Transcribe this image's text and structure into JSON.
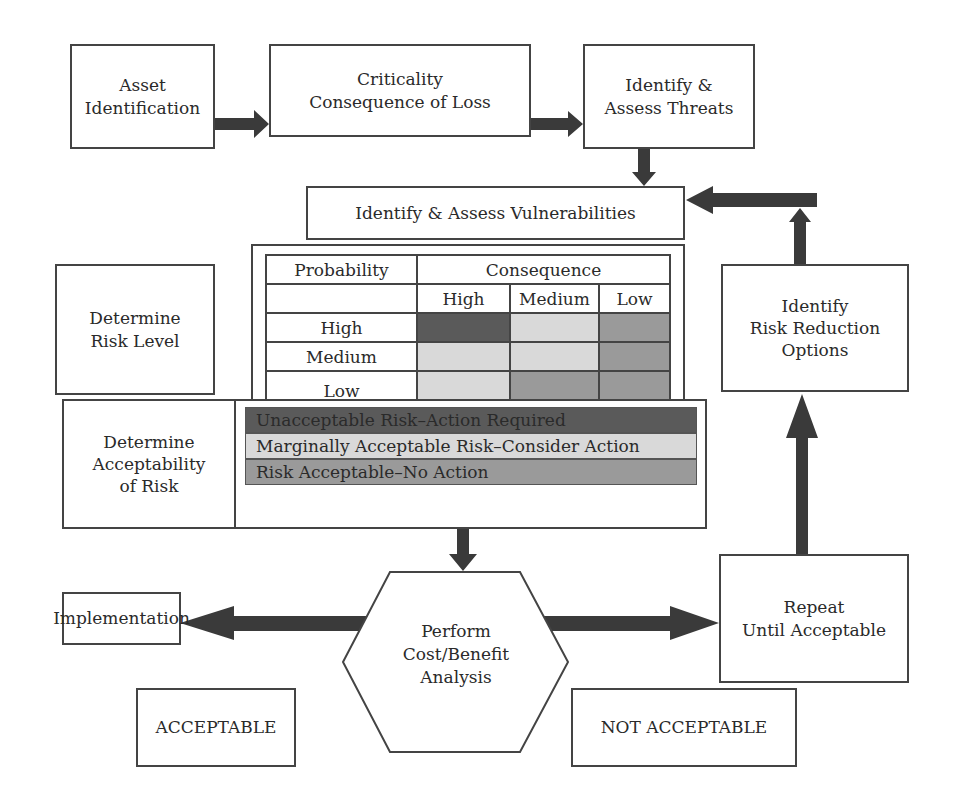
{
  "diagram": {
    "colors": {
      "unacceptable": "#5a5a5a",
      "marginal": "#d9d9d9",
      "acceptable": "#9a9a9a",
      "arrow": "#3a3a3a",
      "border": "#444444"
    },
    "nodes": {
      "asset_identification": {
        "line1": "Asset",
        "line2": "Identification"
      },
      "criticality": {
        "line1": "Criticality",
        "line2": "Consequence of Loss"
      },
      "threats": {
        "line1": "Identify &",
        "line2": "Assess Threats"
      },
      "vulnerabilities": {
        "label": "Identify & Assess Vulnerabilities"
      },
      "risk_level": {
        "line1": "Determine",
        "line2": "Risk Level"
      },
      "acceptability": {
        "line1": "Determine",
        "line2": "Acceptability",
        "line3": "of Risk"
      },
      "risk_reduction": {
        "line1": "Identify",
        "line2": "Risk Reduction",
        "line3": "Options"
      },
      "cost_benefit": {
        "line1": "Perform",
        "line2": "Cost/Benefit",
        "line3": "Analysis"
      },
      "implementation": {
        "label": "Implementation"
      },
      "repeat": {
        "line1": "Repeat",
        "line2": "Until Acceptable"
      },
      "acceptable": {
        "label": "ACCEPTABLE"
      },
      "not_acceptable": {
        "label": "NOT ACCEPTABLE"
      }
    },
    "risk_matrix": {
      "row_header": "Probability",
      "col_header": "Consequence",
      "columns": [
        "High",
        "Medium",
        "Low"
      ],
      "rows": [
        {
          "label": "High",
          "cells": [
            "unacceptable",
            "marginal",
            "acceptable"
          ]
        },
        {
          "label": "Medium",
          "cells": [
            "marginal",
            "marginal",
            "acceptable"
          ]
        },
        {
          "label": "Low",
          "cells": [
            "marginal",
            "acceptable",
            "acceptable"
          ]
        }
      ]
    },
    "legend": [
      {
        "key": "unacceptable",
        "label": "Unacceptable Risk–Action Required"
      },
      {
        "key": "marginal",
        "label": "Marginally Acceptable Risk–Consider Action"
      },
      {
        "key": "acceptable",
        "label": "Risk Acceptable–No Action"
      }
    ],
    "edges": [
      {
        "from": "asset_identification",
        "to": "criticality"
      },
      {
        "from": "criticality",
        "to": "threats"
      },
      {
        "from": "threats",
        "to": "vulnerabilities"
      },
      {
        "from": "acceptability",
        "to": "cost_benefit"
      },
      {
        "from": "cost_benefit",
        "to": "implementation"
      },
      {
        "from": "cost_benefit",
        "to": "repeat"
      },
      {
        "from": "repeat",
        "to": "risk_reduction"
      },
      {
        "from": "risk_reduction",
        "to": "vulnerabilities"
      }
    ]
  }
}
